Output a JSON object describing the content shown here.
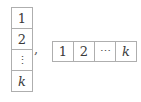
{
  "figure": {
    "column_tableau": {
      "cells": [
        "1",
        "2",
        "⋮",
        "k"
      ]
    },
    "separator": ",",
    "row_tableau": {
      "cells": [
        "1",
        "2",
        "⋯",
        "k"
      ]
    },
    "colors": {
      "background": "#ffffff",
      "cell_border": "#aeaeae",
      "text": "#3a3a3a"
    }
  }
}
